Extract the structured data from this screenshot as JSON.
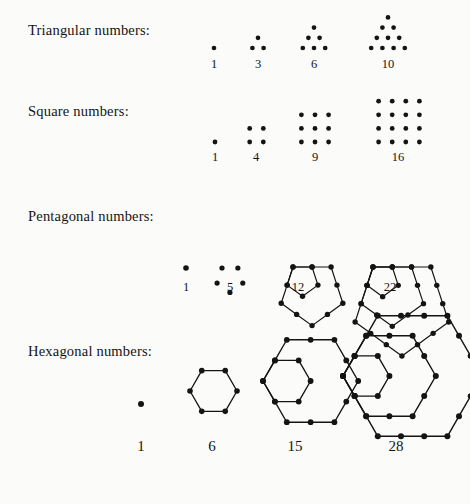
{
  "figure": {
    "background_color": "#fbfbfa",
    "ink_color": "#141414",
    "rows": [
      {
        "key": "triangular",
        "label": "Triangular numbers:",
        "counts": [
          1,
          3,
          6,
          10
        ],
        "count_labels": [
          "1",
          "3",
          "6",
          "10"
        ]
      },
      {
        "key": "square",
        "label": "Square numbers:",
        "counts": [
          1,
          4,
          9,
          16
        ],
        "count_labels": [
          "1",
          "4",
          "9",
          "16"
        ]
      },
      {
        "key": "pentagonal",
        "label": "Pentagonal numbers:",
        "counts": [
          1,
          5,
          12,
          22
        ],
        "count_labels": [
          "1",
          "5",
          "12",
          "22"
        ]
      },
      {
        "key": "hexagonal",
        "label": "Hexagonal numbers:",
        "counts": [
          1,
          6,
          15,
          28
        ],
        "count_labels": [
          "1",
          "6",
          "15",
          "28"
        ]
      }
    ]
  },
  "chart_data": {
    "type": "scatter",
    "xlabel": "",
    "ylabel": "",
    "grid": false,
    "legend": "none",
    "series": [
      {
        "name": "Triangular numbers",
        "categories": [
          "n=1",
          "n=2",
          "n=3",
          "n=4"
        ],
        "values": [
          1,
          3,
          6,
          10
        ]
      },
      {
        "name": "Square numbers",
        "categories": [
          "n=1",
          "n=2",
          "n=3",
          "n=4"
        ],
        "values": [
          1,
          4,
          9,
          16
        ]
      },
      {
        "name": "Pentagonal numbers",
        "categories": [
          "n=1",
          "n=2",
          "n=3",
          "n=4"
        ],
        "values": [
          1,
          5,
          12,
          22
        ]
      },
      {
        "name": "Hexagonal numbers",
        "categories": [
          "n=1",
          "n=2",
          "n=3",
          "n=4"
        ],
        "values": [
          1,
          6,
          15,
          28
        ]
      }
    ],
    "annotations": [
      "Triangular numbers: 1, 3, 6, 10",
      "Square numbers: 1, 4, 9, 16",
      "Pentagonal numbers: 1, 5, 12, 22",
      "Hexagonal numbers: 1, 6, 15, 28"
    ]
  },
  "labels": {
    "tri": {
      "l1": "1",
      "l2": "3",
      "l3": "6",
      "l4": "10"
    },
    "sq": {
      "l1": "1",
      "l2": "4",
      "l3": "9",
      "l4": "16"
    },
    "pent": {
      "l1": "1",
      "l2": "5",
      "l3": "12",
      "l4": "22"
    },
    "hex": {
      "l1": "1",
      "l2": "6",
      "l3": "15",
      "l4": "28"
    }
  }
}
